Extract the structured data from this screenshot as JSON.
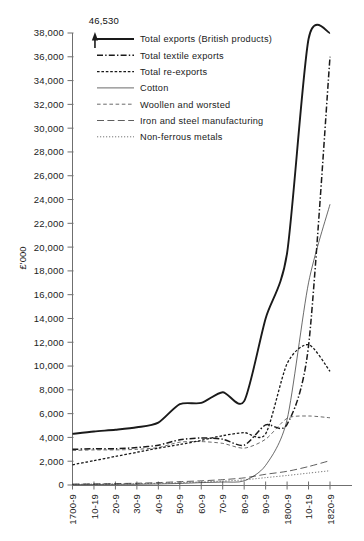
{
  "chart_data": {
    "type": "line",
    "title": "",
    "xlabel": "",
    "ylabel": "£'000",
    "ylim": [
      0,
      38000
    ],
    "ytick_step": 2000,
    "grid": false,
    "legend_position": "top-left-inside",
    "categories": [
      "1700-9",
      "10-19",
      "20-9",
      "30-9",
      "40-9",
      "50-9",
      "60-9",
      "70-9",
      "80-9",
      "90-9",
      "1800-9",
      "10-19",
      "1820-9"
    ],
    "ytick_labels": [
      "0",
      "2,000",
      "4,000",
      "6,000",
      "8,000",
      "10,000",
      "12,000",
      "14,000",
      "16,000",
      "18,000",
      "20,000",
      "22,000",
      "24,000",
      "26,000",
      "28,000",
      "30,000",
      "32,000",
      "34,000",
      "36,000",
      "38,000"
    ],
    "annotations": [
      {
        "text": "46,530",
        "category": "10-19",
        "note": "arrow above Total exports line exceeding axis top"
      }
    ],
    "series": [
      {
        "name": "Total exports (British products)",
        "style": "solid-thick",
        "values": [
          4300,
          4500,
          4650,
          4850,
          5250,
          6800,
          6900,
          7800,
          7050,
          14000,
          19500,
          37500,
          46530
        ]
      },
      {
        "name": "Total textile exports",
        "style": "dash-dot",
        "values": [
          3000,
          3050,
          3050,
          3150,
          3350,
          3800,
          3950,
          3850,
          3350,
          5050,
          5100,
          11700,
          36000
        ]
      },
      {
        "name": "Total re-exports",
        "style": "dotted-dash",
        "values": [
          1700,
          2050,
          2400,
          2750,
          3100,
          3400,
          3750,
          4150,
          4400,
          4300,
          10200,
          11800,
          9550
        ]
      },
      {
        "name": "Cotton",
        "style": "solid-thin",
        "values": [
          30,
          40,
          50,
          60,
          90,
          130,
          200,
          250,
          350,
          1650,
          5500,
          17000,
          23600
        ]
      },
      {
        "name": "Woollen and worsted",
        "style": "dashed-fine",
        "values": [
          2900,
          2950,
          2950,
          3000,
          3150,
          3600,
          3650,
          3500,
          3100,
          3850,
          5600,
          5800,
          5650
        ]
      },
      {
        "name": "Iron and steel manufacturing",
        "style": "dashed-long",
        "values": [
          80,
          100,
          120,
          150,
          200,
          280,
          350,
          450,
          600,
          900,
          1150,
          1550,
          2050
        ]
      },
      {
        "name": "Non-ferrous metals",
        "style": "dotted-fine",
        "values": [
          60,
          80,
          90,
          110,
          150,
          200,
          260,
          330,
          430,
          620,
          800,
          1000,
          1200
        ]
      }
    ]
  },
  "legend": {
    "items": [
      {
        "label": "Total exports (British products)",
        "style": "solid-thick"
      },
      {
        "label": "Total textile exports",
        "style": "dash-dot"
      },
      {
        "label": "Total re-exports",
        "style": "dotted-dash"
      },
      {
        "label": "Cotton",
        "style": "solid-thin"
      },
      {
        "label": "Woollen and worsted",
        "style": "dashed-fine"
      },
      {
        "label": "Iron and steel manufacturing",
        "style": "dashed-long"
      },
      {
        "label": "Non-ferrous metals",
        "style": "dotted-fine"
      }
    ]
  },
  "axes": {
    "y_title": "£'000"
  },
  "colors": {
    "ink": "#1a1a1a",
    "axis": "#6f6f6f",
    "background": "#ffffff"
  }
}
